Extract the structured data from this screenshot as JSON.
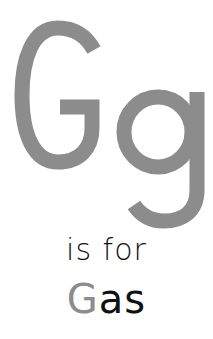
{
  "card": {
    "uppercase": "G",
    "lowercase": "g",
    "caption": "is for",
    "word": {
      "first_letter": "G",
      "rest": "as"
    }
  },
  "colors": {
    "letter_gray": "#8c8c8c",
    "text": "#111111",
    "background": "#ffffff"
  }
}
